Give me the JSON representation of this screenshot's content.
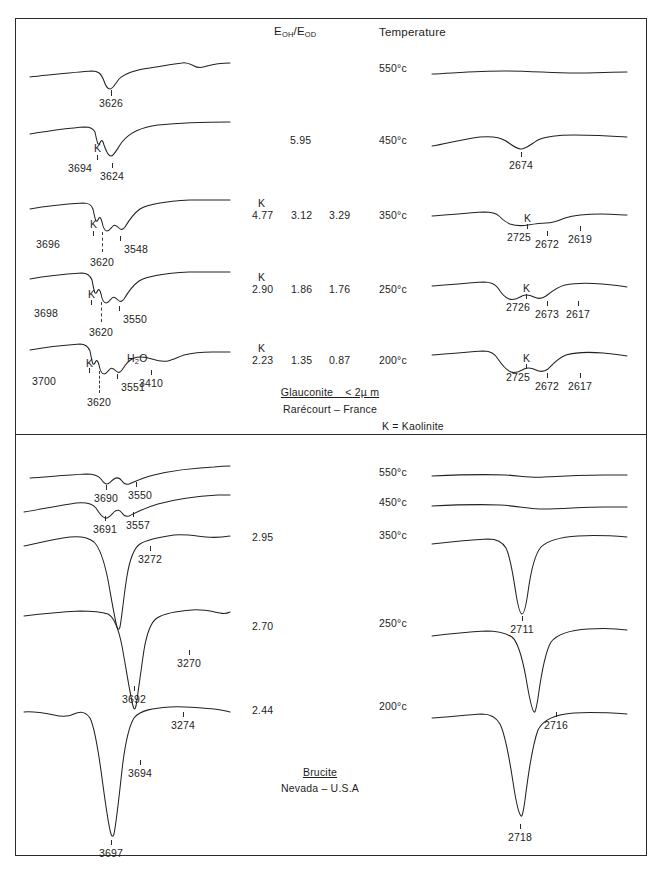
{
  "figure": {
    "headers": {
      "ratio_header_main": "E",
      "ratio_header_sub1": "OH",
      "ratio_header_slash": "/E",
      "ratio_header_sub2": "OD",
      "temperature_header": "Temperature"
    },
    "panels": [
      {
        "id": "glauconite",
        "caption_line1": "Glauconite _ < 2µ m",
        "caption_line2": "Rarécourt – France",
        "caption_note": "K = Kaolinite",
        "rows": [
          {
            "temperature": "550°c",
            "ratios": [],
            "k_label": "",
            "oh_peaks": [
              "3626"
            ],
            "od_peaks": []
          },
          {
            "temperature": "450°c",
            "ratios": [
              "5.95"
            ],
            "k_label": "K",
            "oh_peaks": [
              "3694",
              "3624"
            ],
            "od_peaks": [
              "2674"
            ]
          },
          {
            "temperature": "350°c",
            "ratios": [
              "4.77",
              "3.12",
              "3.29"
            ],
            "k_label": "K",
            "oh_peaks": [
              "3696",
              "3620",
              "3548"
            ],
            "od_peaks": [
              "2725",
              "2672",
              "2619"
            ]
          },
          {
            "temperature": "250°c",
            "ratios": [
              "2.90",
              "1.86",
              "1.76"
            ],
            "k_label": "K",
            "oh_peaks": [
              "3698",
              "3620",
              "3550"
            ],
            "od_peaks": [
              "2726",
              "2673",
              "2617"
            ]
          },
          {
            "temperature": "200°c",
            "ratios": [
              "2.23",
              "1.35",
              "0.87"
            ],
            "k_label": "K",
            "oh_peaks": [
              "3700",
              "3620",
              "3551",
              "3410"
            ],
            "water_label_main": "H",
            "water_label_sub": "2",
            "water_label_end": "O",
            "od_peaks": [
              "2725",
              "2672",
              "2617"
            ]
          }
        ]
      },
      {
        "id": "brucite",
        "caption_line1": "Brucite",
        "caption_line2": "Nevada – U.S.A",
        "caption_note": "",
        "rows": [
          {
            "temperature": "550°c",
            "ratios": [],
            "oh_peaks": [
              "3690",
              "3550"
            ],
            "od_peaks": []
          },
          {
            "temperature": "450°c",
            "ratios": [],
            "oh_peaks": [
              "3691",
              "3557"
            ],
            "od_peaks": []
          },
          {
            "temperature": "350°c",
            "ratios": [
              "2.95"
            ],
            "oh_peaks": [
              "3272"
            ],
            "od_peaks": [
              "2711"
            ]
          },
          {
            "temperature": "250°c",
            "ratios": [
              "2.70"
            ],
            "oh_peaks": [
              "3692",
              "3270"
            ],
            "od_peaks": [
              "2716"
            ]
          },
          {
            "temperature": "200°c",
            "ratios": [
              "2.44"
            ],
            "oh_peaks": [
              "3694",
              "3274",
              "3697"
            ],
            "od_peaks": [
              "2718"
            ]
          }
        ]
      }
    ]
  }
}
